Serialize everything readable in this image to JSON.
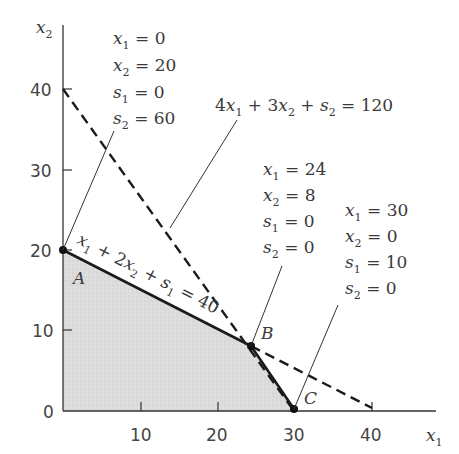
{
  "diagram": {
    "type": "linear-programming-feasible-region",
    "axes": {
      "x_label": "x1",
      "y_label": "x2",
      "x_ticks": [
        "10",
        "20",
        "30",
        "40"
      ],
      "y_ticks": [
        "0",
        "10",
        "20",
        "30",
        "40"
      ]
    },
    "constraints": [
      {
        "label": "x1 + 2x2 + s1 = 40",
        "style": "solid/dashed",
        "intercepts": {
          "x1": 40,
          "x2": 20
        }
      },
      {
        "label": "4x1 + 3x2 + s2 = 120",
        "style": "dashed",
        "intercepts": {
          "x1": 30,
          "x2": 40
        }
      }
    ],
    "vertices": [
      {
        "name": "A",
        "x1": "0",
        "x2": "20",
        "s1": "0",
        "s2": "60"
      },
      {
        "name": "B",
        "x1": "24",
        "x2": "8",
        "s1": "0",
        "s2": "0"
      },
      {
        "name": "C",
        "x1": "30",
        "x2": "0",
        "s1": "10",
        "s2": "0"
      }
    ],
    "labels": {
      "A": [
        "x1 = 0",
        "x2 = 20",
        "s1 = 0",
        "s2 = 60"
      ],
      "B": [
        "x1 = 24",
        "x2 = 8",
        "s1 = 0",
        "s2 = 0"
      ],
      "C": [
        "x1 = 30",
        "x2 = 0",
        "s1 = 10",
        "s2 = 0"
      ]
    },
    "feasible_region_color": "#d9d9d9",
    "line_color": "#1a1a1a"
  }
}
